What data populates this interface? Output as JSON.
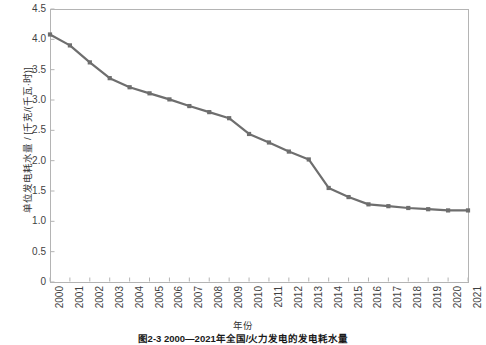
{
  "figure": {
    "caption": "图2-3  2000—2021年全国/火力发电的发电耗水量",
    "xlabel": "年份",
    "ylabel": "单位发电耗水量 / [千克/(千瓦·时)]",
    "line_color": "#6e6e6e",
    "axis_color": "#b4b4b4",
    "background": "#ffffff"
  },
  "chart_data": {
    "type": "line",
    "title": "",
    "xlabel": "年份",
    "ylabel": "单位发电耗水量 / [千克/(千瓦·时)]",
    "categories": [
      "2000",
      "2001",
      "2002",
      "2003",
      "2004",
      "2005",
      "2006",
      "2007",
      "2008",
      "2009",
      "2010",
      "2011",
      "2012",
      "2013",
      "2014",
      "2015",
      "2016",
      "2017",
      "2018",
      "2019",
      "2020",
      "2021"
    ],
    "values": [
      4.08,
      3.9,
      3.62,
      3.36,
      3.21,
      3.11,
      3.01,
      2.9,
      2.8,
      2.7,
      2.44,
      2.3,
      2.15,
      2.02,
      1.55,
      1.4,
      1.28,
      1.25,
      1.22,
      1.2,
      1.18,
      1.18
    ],
    "ylim": [
      0,
      4.5
    ],
    "yticks": [
      "0",
      "0.5",
      "1.0",
      "1.5",
      "2.0",
      "2.5",
      "3.0",
      "3.5",
      "4.0",
      "4.5"
    ],
    "ytick_values": [
      0,
      0.5,
      1.0,
      1.5,
      2.0,
      2.5,
      3.0,
      3.5,
      4.0,
      4.5
    ],
    "xlim": [
      "2000",
      "2021"
    ],
    "grid": false,
    "legend": null,
    "marker": "square",
    "series": [
      {
        "name": "单位发电耗水量",
        "values": [
          4.08,
          3.9,
          3.62,
          3.36,
          3.21,
          3.11,
          3.01,
          2.9,
          2.8,
          2.7,
          2.44,
          2.3,
          2.15,
          2.02,
          1.55,
          1.4,
          1.28,
          1.25,
          1.22,
          1.2,
          1.18,
          1.18
        ]
      }
    ]
  }
}
